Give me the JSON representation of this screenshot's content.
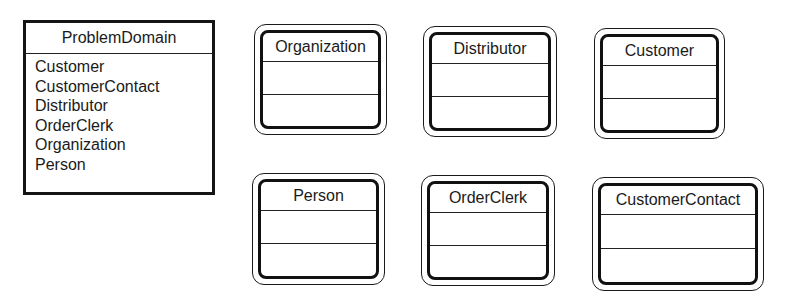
{
  "problem_domain": {
    "title": "ProblemDomain",
    "items": [
      "Customer",
      "CustomerContact",
      "Distributor",
      "OrderClerk",
      "Organization",
      "Person"
    ]
  },
  "classes": [
    {
      "name": "Organization",
      "attributes": [],
      "operations": []
    },
    {
      "name": "Distributor",
      "attributes": [],
      "operations": []
    },
    {
      "name": "Customer",
      "attributes": [],
      "operations": []
    },
    {
      "name": "Person",
      "attributes": [],
      "operations": []
    },
    {
      "name": "OrderClerk",
      "attributes": [],
      "operations": []
    },
    {
      "name": "CustomerContact",
      "attributes": [],
      "operations": []
    }
  ],
  "colors": {
    "stroke": "#111111",
    "background": "#ffffff",
    "text": "#1a1a1a"
  }
}
